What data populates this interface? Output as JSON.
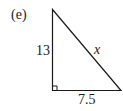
{
  "figure": {
    "part_label": "(e)",
    "shape": "right-triangle",
    "sides": {
      "vertical_leg": "13",
      "hypotenuse": "x",
      "horizontal_leg": "7.5"
    },
    "right_angle_marker": "bottom-left",
    "stroke_color": "#1a1a1a"
  }
}
